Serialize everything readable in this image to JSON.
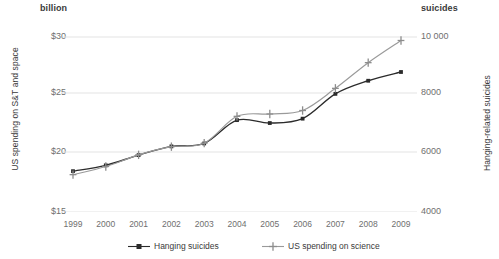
{
  "header": {
    "unit_left": "billion",
    "unit_right": "suicides"
  },
  "axes": {
    "left_title": "US spending on S&T and space",
    "right_title": "Hanging-related suicides",
    "left_ticks": [
      "$30",
      "$25",
      "$20",
      "$15"
    ],
    "right_ticks": [
      "10 000",
      "8000",
      "6000",
      "4000"
    ],
    "x_ticks": [
      "1999",
      "2000",
      "2001",
      "2002",
      "2003",
      "2004",
      "2005",
      "2006",
      "2007",
      "2008",
      "2009"
    ]
  },
  "legend": {
    "items": [
      {
        "label": "Hanging suicides",
        "color": "#2b2b2b",
        "marker": "square-dot-icon"
      },
      {
        "label": "US spending on science",
        "color": "#9a9a9a",
        "marker": "plus-cross-icon"
      }
    ]
  },
  "colors": {
    "series_dark": "#2b2b2b",
    "series_gray": "#9a9a9a",
    "gridline": "#e3e3e3",
    "tick_text": "#6f6f6f",
    "title_text": "#3a3a3a",
    "background": "#ffffff"
  },
  "chart_data": {
    "type": "line",
    "title": "",
    "xlabel": "",
    "grid": true,
    "legend_position": "bottom",
    "x": [
      1999,
      2000,
      2001,
      2002,
      2003,
      2004,
      2005,
      2006,
      2007,
      2008,
      2009
    ],
    "series": [
      {
        "name": "Hanging suicides",
        "axis": "right",
        "ylabel": "Hanging-related suicides",
        "ylim": [
          4000,
          10000
        ],
        "yticks": [
          4000,
          6000,
          8000,
          10000
        ],
        "color": "#2b2b2b",
        "marker": "square-dot-icon",
        "values": [
          5400,
          5600,
          5950,
          6250,
          6350,
          7150,
          7050,
          7200,
          8050,
          8500,
          8800
        ]
      },
      {
        "name": "US spending on science",
        "axis": "left",
        "ylabel": "US spending on S&T and space",
        "ylim": [
          15,
          30
        ],
        "yticks": [
          15,
          20,
          25,
          30
        ],
        "unit": "billion",
        "color": "#9a9a9a",
        "marker": "plus-cross-icon",
        "values": [
          18.2,
          18.9,
          19.9,
          20.6,
          20.9,
          23.2,
          23.4,
          23.7,
          25.6,
          27.8,
          29.7
        ]
      }
    ]
  }
}
